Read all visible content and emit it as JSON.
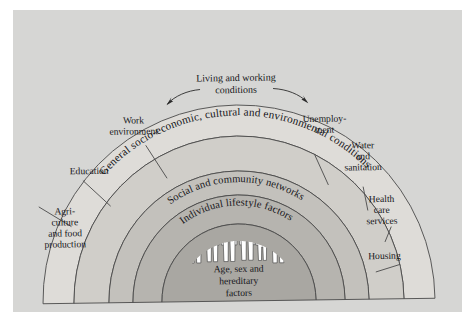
{
  "figure": {
    "background_color": "#d6d6d4",
    "outline_color": "#4a4a4a"
  },
  "arcs": [
    {
      "id": "outer",
      "label": "General socio-economic, cultural and environmental conditions",
      "fill": "#dddbd7",
      "font_size": 11.2
    },
    {
      "id": "living_working",
      "label": "Living and working conditions",
      "fill": "#cfcdc9",
      "font_size": 10
    },
    {
      "id": "social",
      "label": "Social and community networks",
      "fill": "#c2c0bc",
      "font_size": 10.4
    },
    {
      "id": "lifestyle",
      "label": "Individual lifestyle factors",
      "fill": "#b4b2ae",
      "font_size": 10.4
    },
    {
      "id": "core",
      "label": "Age, sex and hereditary factors",
      "fill": "#a7a5a1",
      "font_size": 9.6
    }
  ],
  "segments": [
    {
      "id": "agriculture",
      "lines": [
        "Agri-",
        "culture",
        "and food",
        "production"
      ]
    },
    {
      "id": "education",
      "lines": [
        "Education"
      ]
    },
    {
      "id": "work_environment",
      "lines": [
        "Work",
        "environment"
      ]
    },
    {
      "id": "unemployment",
      "lines": [
        "Unemploy-",
        "ment"
      ]
    },
    {
      "id": "water_sanitation",
      "lines": [
        "Water",
        "and",
        "sanitation"
      ]
    },
    {
      "id": "health_care",
      "lines": [
        "Health",
        "care",
        "services"
      ]
    },
    {
      "id": "housing",
      "lines": [
        "Housing"
      ]
    }
  ],
  "center": {
    "lines": [
      "Age, sex and",
      "hereditary",
      "factors"
    ],
    "people_count": 12
  },
  "living_working_label": {
    "lines": [
      "Living and working",
      "conditions"
    ]
  }
}
